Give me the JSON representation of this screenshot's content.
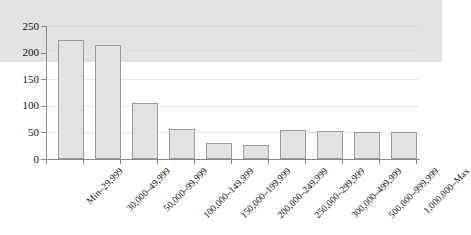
{
  "chart_data": {
    "type": "bar",
    "title": "",
    "subtitle": "",
    "xlabel": "",
    "ylabel": "",
    "categories": [
      "Min–29,999",
      "30,000–49,999",
      "50,000–99,999",
      "100,000–149,999",
      "150,000–199,999",
      "200,000–249,999",
      "250,000–299,999",
      "300,000–499,999",
      "500,000–999,999",
      "1,000,000–Max"
    ],
    "values": [
      117,
      224,
      214,
      105,
      57,
      31,
      27,
      55,
      53,
      50
    ],
    "ylim": [
      0,
      250
    ],
    "ytick_labels": [
      "0",
      "50",
      "100",
      "150",
      "200",
      "250"
    ],
    "ytick_values": [
      0,
      50,
      100,
      150,
      200,
      250
    ],
    "grid": true,
    "legend": null,
    "legend_position": "none",
    "colors": {
      "bar_fill": "#e2e2e2",
      "bar_border": "#9a9a9a",
      "gridline": "#e8e8e8",
      "axis": "#8a8a8a",
      "text": "#111111",
      "background": "#ffffff"
    }
  }
}
